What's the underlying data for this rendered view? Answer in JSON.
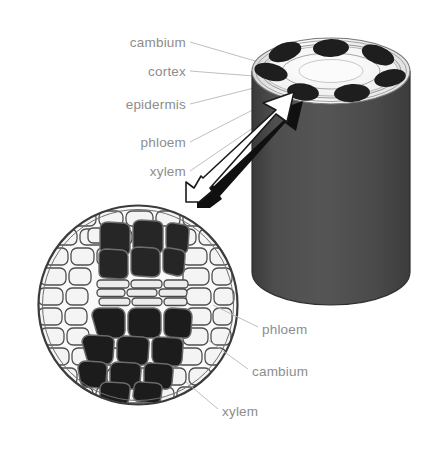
{
  "diagram": {
    "background_color": "#ffffff",
    "label_color": "#8d8d8d",
    "leader_line_color": "#b4b4b4",
    "stem_body_color": "#4a4a4a",
    "stem_rim_color": "#ffffff",
    "bundle_color": "#1c1c1c",
    "cell_wall_color": "#4a4a4a",
    "parenchyma_fill": "#f2f2f2",
    "phloem_fill": "#262626",
    "xylem_fill": "#1a1a1a",
    "cambium_fill": "#e8e8e8",
    "arrow_fill": "#ffffff",
    "arrow_shadow": "#111111"
  },
  "left_labels": [
    {
      "id": "cambium",
      "text": "cambium",
      "x": 186,
      "y": 43,
      "tip_x": 268,
      "tip_y": 66
    },
    {
      "id": "cortex",
      "text": "cortex",
      "x": 186,
      "y": 72,
      "tip_x": 264,
      "tip_y": 78
    },
    {
      "id": "epidermis",
      "text": "epidermis",
      "x": 186,
      "y": 105,
      "tip_x": 257,
      "tip_y": 88
    },
    {
      "id": "phloem",
      "text": "phloem",
      "x": 186,
      "y": 143,
      "tip_x": 280,
      "tip_y": 96
    },
    {
      "id": "xylem",
      "text": "xylem",
      "x": 186,
      "y": 172,
      "tip_x": 292,
      "tip_y": 100
    }
  ],
  "right_labels": [
    {
      "id": "phloem",
      "text": "phloem",
      "x": 262,
      "y": 330,
      "tip_x": 213,
      "tip_y": 305
    },
    {
      "id": "cambium",
      "text": "cambium",
      "x": 252,
      "y": 372,
      "tip_x": 208,
      "tip_y": 340
    },
    {
      "id": "xylem",
      "text": "xylem",
      "x": 222,
      "y": 412,
      "tip_x": 186,
      "tip_y": 382
    }
  ],
  "stem": {
    "label": "stem-cylinder",
    "left": 252,
    "right": 410,
    "top": 38,
    "bottom": 305,
    "top_ellipse_ry": 33,
    "bundle_count": 7
  },
  "magnifier": {
    "label": "magnified-cross-section",
    "center_x": 138,
    "center_y": 305,
    "radius": 100
  },
  "arrow": {
    "label": "magnification-arrow",
    "from_x": 186,
    "from_y": 198,
    "to_x": 292,
    "to_y": 104
  }
}
